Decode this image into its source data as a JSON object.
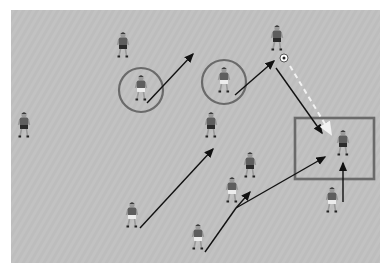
{
  "diagram": {
    "type": "soccer-drill",
    "background": "#ffffff",
    "field": {
      "x": 11,
      "y": 10,
      "width": 369,
      "height": 253,
      "color": "#c2c2c2",
      "stripe": "#bcbcbc"
    },
    "colors": {
      "shirt": "#5e5e5e",
      "shorts_dark": "#2b2b2b",
      "shorts_light": "#ececec",
      "skin": "#9a9a9a",
      "marker": "#6a6a6a",
      "arrow": "#111111",
      "pass": "#f2f2f2"
    },
    "players": [
      {
        "id": "p1",
        "x": 123,
        "y": 45,
        "team": "dark"
      },
      {
        "id": "p2",
        "x": 24,
        "y": 125,
        "team": "dark"
      },
      {
        "id": "p3",
        "x": 141,
        "y": 88,
        "team": "light"
      },
      {
        "id": "p4",
        "x": 224,
        "y": 80,
        "team": "light"
      },
      {
        "id": "p5",
        "x": 277,
        "y": 38,
        "team": "dark"
      },
      {
        "id": "p6",
        "x": 211,
        "y": 125,
        "team": "dark"
      },
      {
        "id": "p7",
        "x": 250,
        "y": 165,
        "team": "dark"
      },
      {
        "id": "p8",
        "x": 232,
        "y": 190,
        "team": "light"
      },
      {
        "id": "p9",
        "x": 132,
        "y": 215,
        "team": "light"
      },
      {
        "id": "p10",
        "x": 198,
        "y": 237,
        "team": "light"
      },
      {
        "id": "p11",
        "x": 343,
        "y": 143,
        "team": "dark"
      },
      {
        "id": "p12",
        "x": 332,
        "y": 200,
        "team": "light"
      }
    ],
    "ball": {
      "x": 284,
      "y": 58,
      "r": 4
    },
    "circles": [
      {
        "id": "c1",
        "cx": 141,
        "cy": 90,
        "r": 22
      },
      {
        "id": "c2",
        "cx": 224,
        "cy": 82,
        "r": 22
      }
    ],
    "box": {
      "x": 295,
      "y": 118,
      "width": 79,
      "height": 61
    },
    "arrows": [
      {
        "id": "a1",
        "x1": 147,
        "y1": 103,
        "x2": 193,
        "y2": 54,
        "style": "solid"
      },
      {
        "id": "a2",
        "x1": 235,
        "y1": 95,
        "x2": 274,
        "y2": 61,
        "style": "solid"
      },
      {
        "id": "a3",
        "x1": 276,
        "y1": 68,
        "x2": 322,
        "y2": 133,
        "style": "solid"
      },
      {
        "id": "a4",
        "x1": 290,
        "y1": 66,
        "x2": 331,
        "y2": 134,
        "style": "dashed"
      },
      {
        "id": "a5",
        "x1": 140,
        "y1": 228,
        "x2": 213,
        "y2": 149,
        "style": "solid"
      },
      {
        "id": "a6",
        "x1": 236,
        "y1": 208,
        "x2": 250,
        "y2": 192,
        "style": "solid"
      },
      {
        "id": "a7",
        "x1": 236,
        "y1": 208,
        "x2": 325,
        "y2": 157,
        "style": "solid"
      },
      {
        "id": "a8",
        "x1": 343,
        "y1": 202,
        "x2": 343,
        "y2": 163,
        "style": "solid"
      }
    ],
    "lines": [
      {
        "id": "l1",
        "x1": 205,
        "y1": 252,
        "x2": 236,
        "y2": 208
      }
    ]
  }
}
